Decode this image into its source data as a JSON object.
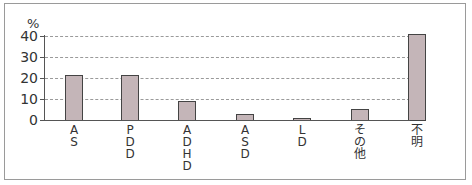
{
  "chart_data": {
    "type": "bar",
    "title": "",
    "xlabel": "",
    "ylabel": "%",
    "ylim": [
      0,
      40
    ],
    "yticks": [
      0,
      10,
      20,
      30,
      40
    ],
    "grid": true,
    "categories": [
      "AS",
      "PDD",
      "ADHD",
      "ASD",
      "LD",
      "その他",
      "不明"
    ],
    "values": [
      21.5,
      21.5,
      9,
      3,
      1,
      5,
      41
    ],
    "bar_color": "#c4b5b8"
  },
  "labels": {
    "unit": "%",
    "yticks": [
      "0",
      "10",
      "20",
      "30",
      "40"
    ],
    "categories": [
      "AS",
      "PDD",
      "ADHD",
      "ASD",
      "LD",
      "その他",
      "不明"
    ]
  }
}
